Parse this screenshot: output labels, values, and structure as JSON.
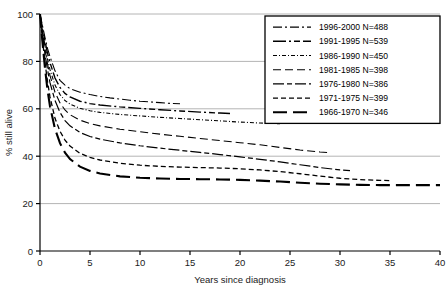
{
  "chart_data": {
    "type": "line",
    "title": "",
    "subtitle": "",
    "xlabel": "Years since diagnosis",
    "ylabel": "% still alive",
    "xlim": [
      0,
      40
    ],
    "ylim": [
      0,
      100
    ],
    "xticks": [
      "0",
      "5",
      "10",
      "15",
      "20",
      "25",
      "30",
      "35",
      "40"
    ],
    "yticks": [
      "0",
      "20",
      "40",
      "60",
      "80",
      "100"
    ],
    "grid": "horizontal",
    "legend_position": "top-right",
    "series": [
      {
        "name": "1996-2000 N=488",
        "label": "1996-2000 N=488",
        "n": 488,
        "period": "1996-2000",
        "dash": "9,3,2,3",
        "width": 1.1,
        "x": [
          0,
          0.25,
          0.5,
          0.75,
          1,
          1.5,
          2,
          2.5,
          3,
          4,
          5,
          6,
          7,
          8,
          9,
          10,
          11,
          12,
          13,
          14
        ],
        "y": [
          100,
          95,
          90,
          85.5,
          82,
          76,
          72,
          70,
          68.5,
          67,
          66,
          65.2,
          64.6,
          64.1,
          63.6,
          63.2,
          62.9,
          62.6,
          62.3,
          62.1
        ]
      },
      {
        "name": "1991-1995 N=539",
        "label": "1991-1995 N=539",
        "n": 539,
        "period": "1991-1995",
        "dash": "13,3,2,3,6,3",
        "width": 1.4,
        "x": [
          0,
          0.25,
          0.5,
          0.75,
          1,
          1.5,
          2,
          2.5,
          3,
          4,
          5,
          6,
          8,
          10,
          12,
          14,
          16,
          18,
          19
        ],
        "y": [
          100,
          94,
          88.5,
          83.5,
          79.5,
          73,
          69,
          66.5,
          65,
          63.2,
          62.2,
          61.6,
          60.8,
          60.2,
          59.6,
          59.1,
          58.6,
          58.2,
          58.0
        ]
      },
      {
        "name": "1986-1990 N=450",
        "label": "1986-1990 N=450",
        "n": 450,
        "period": "1986-1990",
        "dash": "4,2,1,2",
        "width": 1.1,
        "x": [
          0,
          0.25,
          0.5,
          0.75,
          1,
          1.5,
          2,
          2.5,
          3,
          4,
          5,
          6,
          8,
          10,
          12,
          14,
          16,
          18,
          20,
          22,
          24
        ],
        "y": [
          100,
          93,
          86.5,
          81,
          76.5,
          70,
          66,
          63.5,
          62,
          60.2,
          59.2,
          58.5,
          57.6,
          57,
          56.4,
          55.9,
          55.4,
          54.9,
          54.4,
          54.0,
          53.7
        ]
      },
      {
        "name": "1981-1985 N=398",
        "label": "1981-1985 N=398",
        "n": 398,
        "period": "1981-1985",
        "dash": "8,4",
        "width": 1.1,
        "x": [
          0,
          0.25,
          0.5,
          0.75,
          1,
          1.5,
          2,
          2.5,
          3,
          4,
          5,
          6,
          8,
          10,
          12,
          14,
          16,
          18,
          20,
          22,
          24,
          26,
          28,
          29
        ],
        "y": [
          100,
          92,
          85,
          79,
          74,
          67,
          62.5,
          59.5,
          57.5,
          55.2,
          53.8,
          52.8,
          51.4,
          50.3,
          49.3,
          48.4,
          47.5,
          46.6,
          45.7,
          44.8,
          43.7,
          42.6,
          41.8,
          41.5
        ]
      },
      {
        "name": "1976-1980 N=386",
        "label": "1976-1980 N=386",
        "n": 386,
        "period": "1976-1980",
        "dash": "11,3,5,3",
        "width": 1.2,
        "x": [
          0,
          0.25,
          0.5,
          0.75,
          1,
          1.5,
          2,
          2.5,
          3,
          4,
          5,
          6,
          8,
          10,
          12,
          14,
          16,
          18,
          20,
          22,
          24,
          26,
          28,
          30,
          31
        ],
        "y": [
          100,
          91,
          83,
          76.5,
          71,
          63.5,
          58.5,
          55,
          52.8,
          50,
          48.3,
          47.2,
          45.6,
          44.4,
          43.4,
          42.5,
          41.6,
          40.7,
          39.7,
          38.7,
          37.6,
          36.4,
          35.2,
          34.2,
          33.9
        ]
      },
      {
        "name": "1971-1975 N=399",
        "label": "1971-1975 N=399",
        "n": 399,
        "period": "1971-1975",
        "dash": "5,3",
        "width": 1.3,
        "x": [
          0,
          0.25,
          0.5,
          0.75,
          1,
          1.5,
          2,
          2.5,
          3,
          4,
          5,
          6,
          8,
          10,
          12,
          14,
          16,
          18,
          20,
          22,
          24,
          26,
          28,
          30,
          32,
          34,
          35
        ],
        "y": [
          100,
          89,
          79.5,
          71.5,
          65,
          56,
          50.5,
          46.8,
          44.3,
          41.2,
          39.5,
          38.4,
          37.0,
          36.2,
          35.7,
          35.4,
          35.2,
          35.0,
          34.7,
          34.2,
          33.5,
          32.6,
          31.6,
          30.7,
          30.1,
          29.8,
          29.7
        ]
      },
      {
        "name": "1966-1970 N=346",
        "label": "1966-1970 N=346",
        "n": 346,
        "period": "1966-1970",
        "dash": "14,6",
        "width": 2.1,
        "x": [
          0,
          0.25,
          0.5,
          0.75,
          1,
          1.5,
          2,
          2.5,
          3,
          4,
          5,
          6,
          8,
          10,
          12,
          14,
          16,
          18,
          20,
          22,
          24,
          26,
          28,
          30,
          32,
          34,
          36,
          38,
          40
        ],
        "y": [
          100,
          88,
          77,
          68,
          61,
          51.5,
          45.5,
          41.5,
          38.8,
          35.6,
          33.8,
          32.7,
          31.5,
          30.9,
          30.6,
          30.4,
          30.3,
          30.2,
          30.0,
          29.7,
          29.3,
          28.8,
          28.4,
          28.1,
          27.9,
          27.8,
          27.8,
          27.8,
          27.8
        ]
      }
    ]
  },
  "colors": {
    "line": "#000000",
    "axis": "#000000",
    "grid": "#b4b4b4",
    "background": "#ffffff",
    "legend_border": "#000000"
  }
}
